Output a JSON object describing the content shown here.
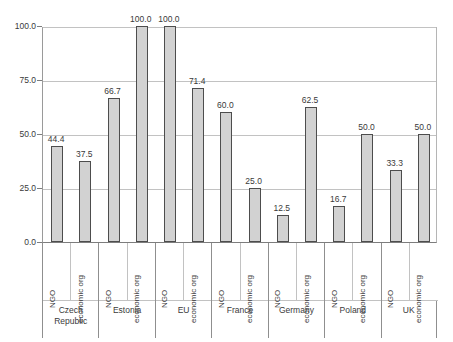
{
  "chart_data": {
    "type": "bar",
    "title": "",
    "subtitle": "",
    "xlabel": "",
    "ylabel": "",
    "ylim": [
      0,
      100
    ],
    "yticks": [
      "0.0",
      "25.0",
      "50.0",
      "75.0",
      "100.0"
    ],
    "ytick_values": [
      0,
      25,
      50,
      75,
      100
    ],
    "grid": true,
    "legend_position": "none",
    "categories": [
      "Czech\nRepublic",
      "Estonia",
      "EU",
      "France",
      "Germany",
      "Poland",
      "UK"
    ],
    "series_labels": [
      "NGO",
      "economic org"
    ],
    "series": [
      {
        "name": "NGO",
        "values": [
          44.4,
          66.7,
          100.0,
          60.0,
          12.5,
          16.7,
          33.3
        ]
      },
      {
        "name": "economic org",
        "values": [
          37.5,
          100.0,
          71.4,
          25.0,
          62.5,
          50.0,
          50.0
        ]
      }
    ],
    "bars": [
      {
        "group": "Czech Republic",
        "series": "NGO",
        "value": 44.4,
        "label": "44.4"
      },
      {
        "group": "Czech Republic",
        "series": "economic org",
        "value": 37.5,
        "label": "37.5"
      },
      {
        "group": "Estonia",
        "series": "NGO",
        "value": 66.7,
        "label": "66.7"
      },
      {
        "group": "Estonia",
        "series": "economic org",
        "value": 100.0,
        "label": "100.0"
      },
      {
        "group": "EU",
        "series": "NGO",
        "value": 100.0,
        "label": "100.0"
      },
      {
        "group": "EU",
        "series": "economic org",
        "value": 71.4,
        "label": "71.4"
      },
      {
        "group": "France",
        "series": "NGO",
        "value": 60.0,
        "label": "60.0"
      },
      {
        "group": "France",
        "series": "economic org",
        "value": 25.0,
        "label": "25.0"
      },
      {
        "group": "Germany",
        "series": "NGO",
        "value": 12.5,
        "label": "12.5"
      },
      {
        "group": "Germany",
        "series": "economic org",
        "value": 62.5,
        "label": "62.5"
      },
      {
        "group": "Poland",
        "series": "NGO",
        "value": 16.7,
        "label": "16.7"
      },
      {
        "group": "Poland",
        "series": "economic org",
        "value": 50.0,
        "label": "50.0"
      },
      {
        "group": "UK",
        "series": "NGO",
        "value": 33.3,
        "label": "33.3"
      },
      {
        "group": "UK",
        "series": "economic org",
        "value": 50.0,
        "label": "50.0"
      }
    ],
    "colors": {
      "bar_fill": "#d2d2d2",
      "bar_border": "#4d4d4d",
      "gridline": "#c2c2c2",
      "axis": "#7d7d7d",
      "text": "#3a3a3a",
      "background": "#ffffff"
    }
  }
}
